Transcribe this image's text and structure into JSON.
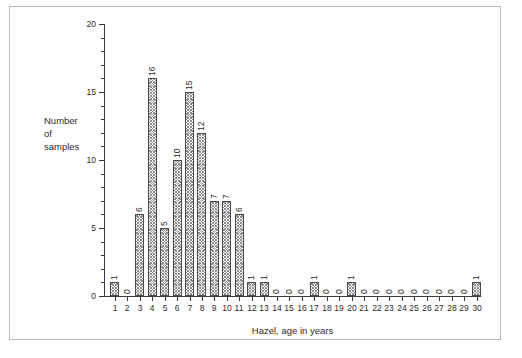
{
  "chart_data": {
    "type": "bar",
    "title": "",
    "xlabel": "Hazel, age in years",
    "ylabel": "Number of samples",
    "ylabel_lines": [
      "Number",
      "of",
      "samples"
    ],
    "categories": [
      1,
      2,
      3,
      4,
      5,
      6,
      7,
      8,
      9,
      10,
      11,
      12,
      13,
      14,
      15,
      16,
      17,
      18,
      19,
      20,
      21,
      22,
      23,
      24,
      25,
      26,
      27,
      28,
      29,
      30
    ],
    "values": [
      1,
      0,
      6,
      16,
      5,
      10,
      15,
      12,
      7,
      7,
      6,
      1,
      1,
      0,
      0,
      0,
      1,
      0,
      0,
      1,
      0,
      0,
      0,
      0,
      0,
      0,
      0,
      0,
      0,
      1
    ],
    "data_labels": [
      "1",
      "0",
      "6",
      "16",
      "5",
      "10",
      "15",
      "12",
      "7",
      "7",
      "6",
      "1",
      "1",
      "0",
      "0",
      "0",
      "1",
      "0",
      "0",
      "1",
      "0",
      "0",
      "0",
      "0",
      "0",
      "0",
      "0",
      "0",
      "0",
      "1"
    ],
    "ylim": [
      0,
      20
    ],
    "y_major_ticks": [
      0,
      5,
      10,
      15,
      20
    ],
    "y_major_tick_labels": [
      "0",
      "5",
      "10",
      "15",
      "20"
    ],
    "y_minor_tick_step": 1,
    "xlim": [
      0.4,
      30.6
    ],
    "grid": false,
    "legend": null,
    "bar_fill": "crosshatch-gray",
    "bar_edge_color": "#4a4a4a",
    "axis_color": "#3a3a3a",
    "frame_color": "#b9b9b9",
    "background": "#ffffff",
    "data_label_rotation": -90
  }
}
